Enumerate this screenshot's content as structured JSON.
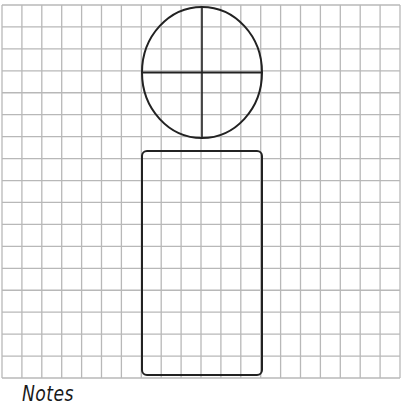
{
  "diagram": {
    "type": "grid-sketch-template",
    "grid": {
      "left": 2,
      "top": 5,
      "right": 400,
      "bottom": 378,
      "columns": 20,
      "rows": 17,
      "line_color": "#b8b8b8",
      "line_width": 1.3
    },
    "shapes": [
      {
        "id": "head",
        "kind": "ellipse",
        "cx": 202,
        "cy": 72.5,
        "rx": 60,
        "ry": 65.5,
        "stroke": "#222222",
        "stroke_width": 2,
        "crosshair": true
      },
      {
        "id": "body",
        "kind": "rounded-rect",
        "x": 142,
        "y": 151,
        "width": 120,
        "height": 224,
        "radius": 5,
        "stroke": "#222222",
        "stroke_width": 2
      }
    ],
    "notes_label": "Notes"
  }
}
